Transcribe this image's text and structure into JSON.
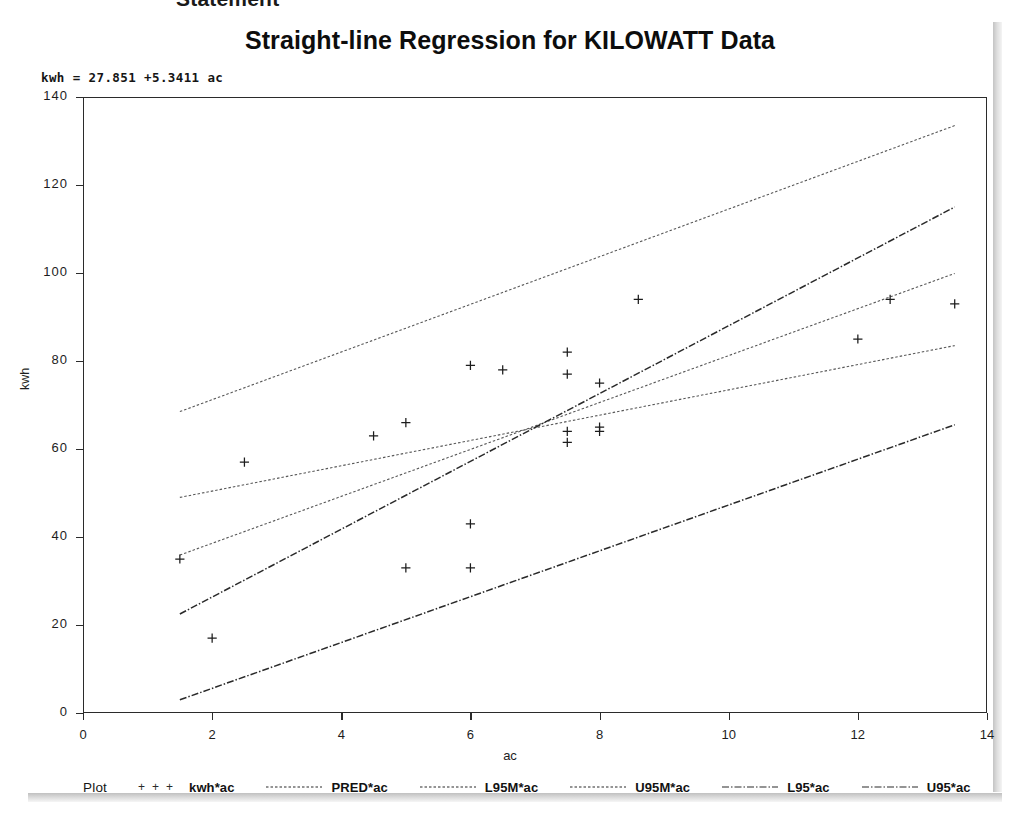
{
  "document": {
    "cropped_heading": "Statement"
  },
  "chart_data": {
    "type": "scatter",
    "title": "Straight-line Regression for KILOWATT Data",
    "annotation": "kwh = 27.851 +5.3411 ac",
    "xlabel": "ac",
    "ylabel": "kwh",
    "xlim": [
      0,
      14
    ],
    "ylim": [
      0,
      140
    ],
    "xticks": [
      0,
      2,
      4,
      6,
      8,
      10,
      12,
      14
    ],
    "yticks": [
      0,
      20,
      40,
      60,
      80,
      100,
      120,
      140
    ],
    "grid": false,
    "legend_title": "Plot",
    "legend_position": "bottom",
    "regression": {
      "intercept": 27.851,
      "slope": 5.3411
    },
    "series": [
      {
        "name": "kwh*ac",
        "type": "scatter",
        "marker": "plus",
        "points": [
          [
            1.5,
            35.0
          ],
          [
            2.0,
            17.0
          ],
          [
            2.5,
            57.0
          ],
          [
            4.5,
            63.0
          ],
          [
            5.0,
            33.0
          ],
          [
            5.0,
            66.0
          ],
          [
            6.0,
            79.0
          ],
          [
            6.0,
            43.0
          ],
          [
            6.0,
            33.0
          ],
          [
            6.5,
            78.0
          ],
          [
            7.5,
            82.0
          ],
          [
            7.5,
            77.0
          ],
          [
            7.5,
            64.0
          ],
          [
            7.5,
            61.5
          ],
          [
            8.0,
            75.0
          ],
          [
            8.0,
            65.0
          ],
          [
            8.0,
            64.0
          ],
          [
            8.6,
            94.0
          ],
          [
            12.0,
            85.0
          ],
          [
            12.5,
            94.0
          ],
          [
            13.5,
            93.0
          ]
        ]
      },
      {
        "name": "PRED*ac",
        "type": "line",
        "style": "dotted-fine",
        "x": [
          1.5,
          13.5
        ],
        "y": [
          35.9,
          99.9
        ]
      },
      {
        "name": "L95M*ac",
        "type": "line",
        "style": "dotted-fine",
        "x": [
          1.5,
          13.5
        ],
        "y": [
          49.0,
          83.5
        ]
      },
      {
        "name": "U95M*ac",
        "type": "line",
        "style": "dotted-fine",
        "x": [
          1.5,
          13.5
        ],
        "y": [
          68.5,
          133.5
        ]
      },
      {
        "name": "L95*ac",
        "type": "line",
        "style": "dash-dot",
        "x": [
          1.5,
          13.5
        ],
        "y": [
          3.0,
          65.5
        ]
      },
      {
        "name": "U95*ac",
        "type": "line",
        "style": "dash-dot",
        "x": [
          1.5,
          13.5
        ],
        "y": [
          22.5,
          115.0
        ]
      }
    ],
    "legend_entries": [
      {
        "label": "kwh*ac",
        "symbol": "plus"
      },
      {
        "label": "PRED*ac",
        "symbol": "line"
      },
      {
        "label": "L95M*ac",
        "symbol": "line"
      },
      {
        "label": "U95M*ac",
        "symbol": "line"
      },
      {
        "label": "L95*ac",
        "symbol": "line"
      },
      {
        "label": "U95*ac",
        "symbol": "line"
      }
    ]
  },
  "colors": {
    "ink": "#1d1d1d",
    "frame": "#2b2b2b",
    "paper": "#ffffff"
  }
}
